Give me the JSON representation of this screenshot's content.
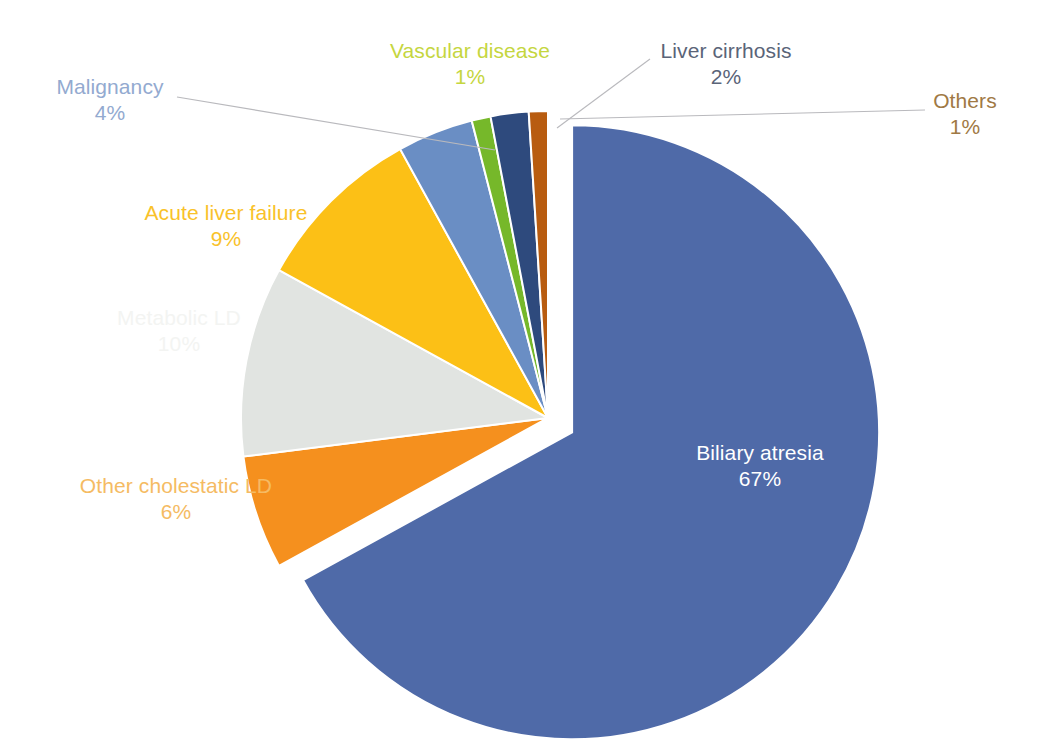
{
  "chart_data": {
    "type": "pie",
    "title": "",
    "subtitle": "",
    "legend_position": "none",
    "grid": false,
    "labels_inline": true,
    "total_percent": 100,
    "start_angle_deg": 0,
    "direction": "clockwise",
    "exploded_slice": "Biliary atresia",
    "categories": [
      "Biliary atresia",
      "Other cholestatic LD",
      "Metabolic LD",
      "Acute liver failure",
      "Malignancy",
      "Vascular disease",
      "Liver cirrhosis",
      "Others"
    ],
    "values": [
      67,
      6,
      10,
      9,
      4,
      1,
      2,
      1
    ],
    "colors": [
      "#4f6aa8",
      "#f5901e",
      "#e1e4e1",
      "#fcc016",
      "#6a8ec4",
      "#76b82a",
      "#2e4a7d",
      "#b85c10"
    ],
    "slices": [
      {
        "label": "Biliary atresia",
        "percent": 67,
        "percent_text": "67%",
        "color": "#4f6aa8",
        "label_color": "#ffffff",
        "label_placement": "inside",
        "exploded": true
      },
      {
        "label": "Other cholestatic LD",
        "percent": 6,
        "percent_text": "6%",
        "color": "#f5901e",
        "label_color": "#f5bb63",
        "label_placement": "outside",
        "exploded": false
      },
      {
        "label": "Metabolic LD",
        "percent": 10,
        "percent_text": "10%",
        "color": "#e1e4e1",
        "label_color": "#f3f4f2",
        "label_placement": "outside",
        "exploded": false
      },
      {
        "label": "Acute liver failure",
        "percent": 9,
        "percent_text": "9%",
        "color": "#fcc016",
        "label_color": "#f9c22a",
        "label_placement": "outside",
        "exploded": false
      },
      {
        "label": "Malignancy",
        "percent": 4,
        "percent_text": "4%",
        "color": "#6a8ec4",
        "label_color": "#93aad0",
        "label_placement": "outside",
        "exploded": false,
        "leader_line": true
      },
      {
        "label": "Vascular disease",
        "percent": 1,
        "percent_text": "1%",
        "color": "#76b82a",
        "label_color": "#c5d63f",
        "label_placement": "outside",
        "exploded": false
      },
      {
        "label": "Liver cirrhosis",
        "percent": 2,
        "percent_text": "2%",
        "color": "#2e4a7d",
        "label_color": "#5a6478",
        "label_placement": "outside",
        "exploded": false,
        "leader_line": true
      },
      {
        "label": "Others",
        "percent": 1,
        "percent_text": "1%",
        "color": "#b85c10",
        "label_color": "#a07944",
        "label_placement": "outside",
        "exploded": false,
        "leader_line": true
      }
    ]
  },
  "labels": {
    "biliary": {
      "name": "Biliary atresia",
      "pct": "67%"
    },
    "cholestatic": {
      "name": "Other cholestatic LD",
      "pct": "6%"
    },
    "metabolic": {
      "name": "Metabolic LD",
      "pct": "10%"
    },
    "acute": {
      "name": "Acute liver failure",
      "pct": "9%"
    },
    "malignancy": {
      "name": "Malignancy",
      "pct": "4%"
    },
    "vascular": {
      "name": "Vascular disease",
      "pct": "1%"
    },
    "cirrhosis": {
      "name": "Liver cirrhosis",
      "pct": "2%"
    },
    "others": {
      "name": "Others",
      "pct": "1%"
    }
  }
}
